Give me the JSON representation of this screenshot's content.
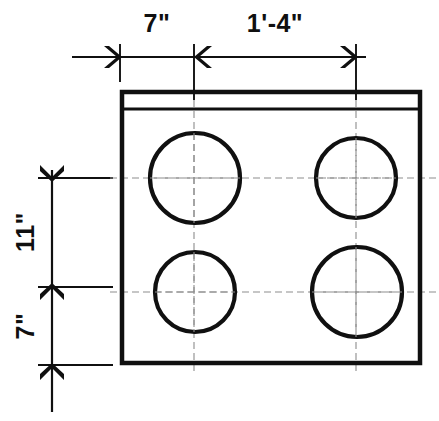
{
  "drawing": {
    "title": "Plan view of a rectangular slab with four circular openings",
    "units": "imperial-feet-inches",
    "background_color": "#ffffff",
    "line_color": "#101010",
    "centerline_color": "#8d8d8d",
    "dimensions": {
      "horizontal": [
        {
          "id": "dim-h-7in",
          "label": "7\"",
          "orientation": "horizontal",
          "from_x": 120,
          "to_x": 194,
          "text_x": 157,
          "text_y": 32,
          "line_y": 57
        },
        {
          "id": "dim-h-1ft4in",
          "label": "1'-4\"",
          "orientation": "horizontal",
          "from_x": 194,
          "to_x": 356,
          "text_x": 275,
          "text_y": 32,
          "line_y": 57
        }
      ],
      "vertical": [
        {
          "id": "dim-v-11in",
          "label": "11\"",
          "orientation": "vertical",
          "from_y": 178,
          "to_y": 287,
          "text_x": 34,
          "text_y": 232,
          "line_x": 52
        },
        {
          "id": "dim-v-7in",
          "label": "7\"",
          "orientation": "vertical",
          "from_y": 287,
          "to_y": 365,
          "text_x": 34,
          "text_y": 326,
          "line_x": 52
        }
      ]
    },
    "slab": {
      "id": "slab-outline",
      "x": 122,
      "y": 92,
      "width": 298,
      "height": 271,
      "stroke_width": 4.5,
      "top_band_y": 109,
      "top_band_stroke_width": 3.2
    },
    "openings": [
      {
        "id": "opening-top-left",
        "cx": 195,
        "cy": 178,
        "r": 45
      },
      {
        "id": "opening-top-right",
        "cx": 356,
        "cy": 178,
        "r": 40
      },
      {
        "id": "opening-bottom-left",
        "cx": 195,
        "cy": 292,
        "r": 40
      },
      {
        "id": "opening-bottom-right",
        "cx": 357,
        "cy": 292,
        "r": 45
      }
    ],
    "centerlines": {
      "vertical": [
        {
          "id": "centerline-v-left",
          "x": 194,
          "y1": 100,
          "y2": 372
        },
        {
          "id": "centerline-v-right",
          "x": 356,
          "y1": 100,
          "y2": 372
        }
      ],
      "horizontal": [
        {
          "id": "centerline-h-top",
          "y": 178,
          "x1": 110,
          "x2": 436
        },
        {
          "id": "centerline-h-bottom",
          "y": 292,
          "x1": 110,
          "x2": 436
        }
      ]
    },
    "extension_lines": {
      "top": [
        {
          "id": "ext-top-left",
          "x": 120,
          "y1": 44,
          "y2": 82
        },
        {
          "id": "ext-top-mid",
          "x": 194,
          "y1": 44,
          "y2": 100
        },
        {
          "id": "ext-top-right",
          "x": 356,
          "y1": 44,
          "y2": 100
        }
      ],
      "left": [
        {
          "id": "ext-left-top",
          "y": 178,
          "x1": 38,
          "x2": 113
        },
        {
          "id": "ext-left-mid",
          "y": 287,
          "x1": 38,
          "x2": 113
        },
        {
          "id": "ext-left-bottom",
          "y": 365,
          "x1": 38,
          "x2": 113
        }
      ]
    },
    "dim_line_spans": {
      "top": {
        "id": "dim-line-top",
        "y": 57,
        "x1": 72,
        "x2": 366
      },
      "left": {
        "id": "dim-line-left",
        "x": 52,
        "y1": 170,
        "y2": 412
      }
    }
  }
}
